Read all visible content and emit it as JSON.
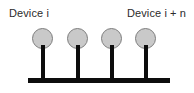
{
  "diagram": {
    "background_color": "#ffffff",
    "labels": {
      "left": "Device i",
      "right": "Device i + n"
    },
    "colors": {
      "node_fill": "#c9c9c9",
      "node_stroke": "#7d7d7d",
      "stem": "#0d0d0d",
      "base": "#0d0d0d",
      "text": "#2b2b2b"
    },
    "base": {
      "x": 28,
      "y": 78,
      "width": 142,
      "height": 5
    },
    "nodes": [
      {
        "name": "device-node-1",
        "x": 32,
        "y": 28
      },
      {
        "name": "device-node-2",
        "x": 67,
        "y": 28
      },
      {
        "name": "device-node-3",
        "x": 101,
        "y": 28
      },
      {
        "name": "device-node-4",
        "x": 135,
        "y": 28
      }
    ]
  }
}
